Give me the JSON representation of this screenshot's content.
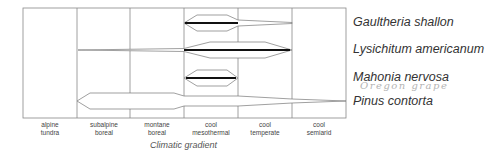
{
  "diagram": {
    "axis_title": "Climatic gradient",
    "zones": [
      {
        "line1": "alpine",
        "line2": "tundra"
      },
      {
        "line1": "subalpine",
        "line2": "boreal"
      },
      {
        "line1": "montane",
        "line2": "boreal"
      },
      {
        "line1": "cool",
        "line2": "mesothermal"
      },
      {
        "line1": "cool",
        "line2": "temperate"
      },
      {
        "line1": "cool",
        "line2": "semiarid"
      }
    ],
    "species": [
      {
        "name": "Gaultheria shallon",
        "range_from": "cool mesothermal",
        "range_to": "cool temperate (tail to cool semiarid edge)",
        "optimum": "cool mesothermal"
      },
      {
        "name": "Lysichitum americanum",
        "range_from": "subalpine boreal (tail)",
        "range_to": "cool temperate",
        "optimum": "cool mesothermal – cool temperate"
      },
      {
        "name": "Mahonia nervosa",
        "range_from": "cool mesothermal",
        "range_to": "cool mesothermal",
        "optimum": "cool mesothermal"
      },
      {
        "name": "Pinus contorta",
        "range_from": "subalpine boreal",
        "range_to": "cool semiarid",
        "optimum": "subalpine boreal – cool temperate"
      }
    ],
    "annotation": "Oregon grape"
  }
}
